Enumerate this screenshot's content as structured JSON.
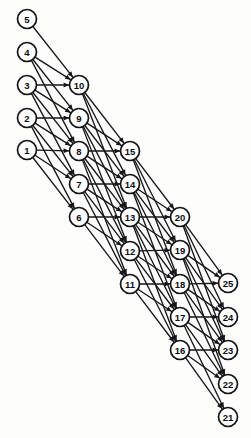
{
  "diagram": {
    "kind": "layered-directed-graph",
    "title": "",
    "canvas": {
      "width": 251,
      "height": 438
    },
    "style": {
      "background": "#fdfdfc",
      "node_fill": "#ffffff",
      "node_stroke": "#131216",
      "edge_color": "#17161a",
      "label_color": "#0d0c10",
      "node_radius": 9.5,
      "edge_width": 1.35
    },
    "layer_count": 5,
    "nodes_per_layer": 5,
    "nodes": [
      {
        "id": 5,
        "label": "5",
        "x": 27,
        "y": 19,
        "layer": 0,
        "row": 0
      },
      {
        "id": 4,
        "label": "4",
        "x": 27,
        "y": 52,
        "layer": 0,
        "row": 1
      },
      {
        "id": 3,
        "label": "3",
        "x": 27,
        "y": 85,
        "layer": 0,
        "row": 2
      },
      {
        "id": 2,
        "label": "2",
        "x": 27,
        "y": 118,
        "layer": 0,
        "row": 3
      },
      {
        "id": 1,
        "label": "1",
        "x": 27,
        "y": 150,
        "layer": 0,
        "row": 4
      },
      {
        "id": 10,
        "label": "10",
        "x": 79,
        "y": 85,
        "layer": 1,
        "row": 0
      },
      {
        "id": 9,
        "label": "9",
        "x": 79,
        "y": 118,
        "layer": 1,
        "row": 1
      },
      {
        "id": 8,
        "label": "8",
        "x": 79,
        "y": 151,
        "layer": 1,
        "row": 2
      },
      {
        "id": 7,
        "label": "7",
        "x": 79,
        "y": 184,
        "layer": 1,
        "row": 3
      },
      {
        "id": 6,
        "label": "6",
        "x": 79,
        "y": 217,
        "layer": 1,
        "row": 4
      },
      {
        "id": 15,
        "label": "15",
        "x": 130,
        "y": 151,
        "layer": 2,
        "row": 0
      },
      {
        "id": 14,
        "label": "14",
        "x": 130,
        "y": 184,
        "layer": 2,
        "row": 1
      },
      {
        "id": 13,
        "label": "13",
        "x": 130,
        "y": 217,
        "layer": 2,
        "row": 2
      },
      {
        "id": 12,
        "label": "12",
        "x": 130,
        "y": 251,
        "layer": 2,
        "row": 3
      },
      {
        "id": 11,
        "label": "11",
        "x": 130,
        "y": 284,
        "layer": 2,
        "row": 4
      },
      {
        "id": 20,
        "label": "20",
        "x": 180,
        "y": 217,
        "layer": 3,
        "row": 0
      },
      {
        "id": 19,
        "label": "19",
        "x": 180,
        "y": 250,
        "layer": 3,
        "row": 1
      },
      {
        "id": 18,
        "label": "18",
        "x": 180,
        "y": 284,
        "layer": 3,
        "row": 2
      },
      {
        "id": 17,
        "label": "17",
        "x": 180,
        "y": 317,
        "layer": 3,
        "row": 3
      },
      {
        "id": 16,
        "label": "16",
        "x": 180,
        "y": 350,
        "layer": 3,
        "row": 4
      },
      {
        "id": 25,
        "label": "25",
        "x": 228,
        "y": 283,
        "layer": 4,
        "row": 0
      },
      {
        "id": 24,
        "label": "24",
        "x": 228,
        "y": 317,
        "layer": 4,
        "row": 1
      },
      {
        "id": 23,
        "label": "23",
        "x": 228,
        "y": 350,
        "layer": 4,
        "row": 2
      },
      {
        "id": 22,
        "label": "22",
        "x": 228,
        "y": 384,
        "layer": 4,
        "row": 3
      },
      {
        "id": 21,
        "label": "21",
        "x": 228,
        "y": 417,
        "layer": 4,
        "row": 4
      }
    ],
    "edges": [
      {
        "from": 5,
        "to": 10
      },
      {
        "from": 4,
        "to": 10
      },
      {
        "from": 4,
        "to": 9
      },
      {
        "from": 4,
        "to": 8
      },
      {
        "from": 3,
        "to": 10
      },
      {
        "from": 3,
        "to": 9
      },
      {
        "from": 3,
        "to": 8
      },
      {
        "from": 3,
        "to": 7
      },
      {
        "from": 2,
        "to": 9
      },
      {
        "from": 2,
        "to": 8
      },
      {
        "from": 2,
        "to": 7
      },
      {
        "from": 2,
        "to": 6
      },
      {
        "from": 1,
        "to": 8
      },
      {
        "from": 1,
        "to": 7
      },
      {
        "from": 1,
        "to": 6
      },
      {
        "from": 10,
        "to": 15
      },
      {
        "from": 10,
        "to": 14
      },
      {
        "from": 10,
        "to": 13
      },
      {
        "from": 9,
        "to": 15
      },
      {
        "from": 9,
        "to": 14
      },
      {
        "from": 9,
        "to": 13
      },
      {
        "from": 9,
        "to": 12
      },
      {
        "from": 8,
        "to": 15
      },
      {
        "from": 8,
        "to": 14
      },
      {
        "from": 8,
        "to": 13
      },
      {
        "from": 8,
        "to": 12
      },
      {
        "from": 8,
        "to": 11
      },
      {
        "from": 7,
        "to": 14
      },
      {
        "from": 7,
        "to": 13
      },
      {
        "from": 7,
        "to": 12
      },
      {
        "from": 7,
        "to": 11
      },
      {
        "from": 6,
        "to": 13
      },
      {
        "from": 6,
        "to": 12
      },
      {
        "from": 6,
        "to": 11
      },
      {
        "from": 15,
        "to": 20
      },
      {
        "from": 15,
        "to": 19
      },
      {
        "from": 15,
        "to": 18
      },
      {
        "from": 14,
        "to": 20
      },
      {
        "from": 14,
        "to": 19
      },
      {
        "from": 14,
        "to": 18
      },
      {
        "from": 14,
        "to": 17
      },
      {
        "from": 13,
        "to": 20
      },
      {
        "from": 13,
        "to": 19
      },
      {
        "from": 13,
        "to": 18
      },
      {
        "from": 13,
        "to": 17
      },
      {
        "from": 13,
        "to": 16
      },
      {
        "from": 12,
        "to": 19
      },
      {
        "from": 12,
        "to": 18
      },
      {
        "from": 12,
        "to": 17
      },
      {
        "from": 12,
        "to": 16
      },
      {
        "from": 11,
        "to": 18
      },
      {
        "from": 11,
        "to": 17
      },
      {
        "from": 11,
        "to": 16
      },
      {
        "from": 20,
        "to": 25
      },
      {
        "from": 20,
        "to": 24
      },
      {
        "from": 20,
        "to": 23
      },
      {
        "from": 19,
        "to": 25
      },
      {
        "from": 19,
        "to": 24
      },
      {
        "from": 19,
        "to": 23
      },
      {
        "from": 19,
        "to": 22
      },
      {
        "from": 18,
        "to": 25
      },
      {
        "from": 18,
        "to": 24
      },
      {
        "from": 18,
        "to": 23
      },
      {
        "from": 18,
        "to": 22
      },
      {
        "from": 17,
        "to": 24
      },
      {
        "from": 17,
        "to": 23
      },
      {
        "from": 17,
        "to": 22
      },
      {
        "from": 17,
        "to": 21
      },
      {
        "from": 16,
        "to": 23
      },
      {
        "from": 16,
        "to": 22
      },
      {
        "from": 16,
        "to": 21
      }
    ]
  }
}
